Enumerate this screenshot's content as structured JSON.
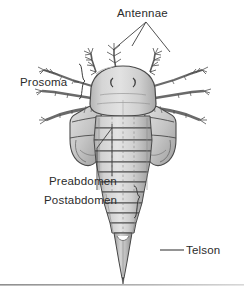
{
  "figure": {
    "background_color": "#ffffff",
    "ink_color": "#3a3a3a",
    "label_color": "#2b2b2b",
    "body_fill": "#c9c9c9",
    "body_fill_light": "#dcdcdc",
    "body_fill_dark": "#9c9c9c",
    "baseline_rule_color": "#9a9a9a"
  },
  "labels": {
    "antennae": "Antennae",
    "prosoma": "Prosoma",
    "preabdomen": "Preabdomen",
    "postabdomen": "Postabdomen",
    "telson": "Telson"
  },
  "leaders": {
    "antennae_targets": 3,
    "prosoma_brace": "right-curly-brace",
    "preabdomen_leader": "diagonal-line-with-elbow",
    "postabdomen_brace": "right-curly-brace",
    "telson_leader": "horizontal-line"
  }
}
